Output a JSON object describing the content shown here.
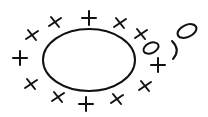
{
  "diagram": {
    "stroke_color": "#111111",
    "background": "#ffffff",
    "main_ellipse": {
      "cx": 89,
      "cy": 60,
      "rx": 46,
      "ry": 31
    },
    "marks": [
      {
        "type": "plus",
        "x": 20,
        "y": 58
      },
      {
        "type": "cross",
        "x": 31,
        "y": 84
      },
      {
        "type": "cross",
        "x": 32,
        "y": 35
      },
      {
        "type": "cross",
        "x": 55,
        "y": 22
      },
      {
        "type": "plus",
        "x": 89,
        "y": 18
      },
      {
        "type": "cross",
        "x": 120,
        "y": 23
      },
      {
        "type": "cross",
        "x": 141,
        "y": 34
      },
      {
        "type": "plus",
        "x": 158,
        "y": 65
      },
      {
        "type": "cross",
        "x": 145,
        "y": 86
      },
      {
        "type": "cross",
        "x": 117,
        "y": 99
      },
      {
        "type": "plus",
        "x": 86,
        "y": 104
      },
      {
        "type": "cross",
        "x": 58,
        "y": 97
      }
    ],
    "extra_glyphs": [
      {
        "type": "small-ellipse",
        "cx": 151,
        "cy": 48,
        "rx": 8,
        "ry": 5,
        "rotate": -25
      },
      {
        "type": "paren",
        "x": 175,
        "y": 50
      },
      {
        "type": "small-ellipse",
        "cx": 187,
        "cy": 31,
        "rx": 10,
        "ry": 6,
        "rotate": -25
      }
    ]
  }
}
